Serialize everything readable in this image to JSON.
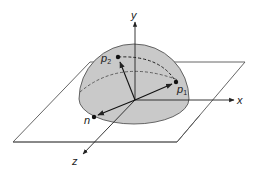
{
  "diagram": {
    "type": "hemisphere-on-plane",
    "axes": {
      "x_label": "x",
      "y_label": "y",
      "z_label": "z"
    },
    "points": {
      "p2": {
        "label": "p",
        "sub": "2"
      },
      "p1": {
        "label": "p",
        "sub": "1"
      },
      "n": {
        "label": "n"
      }
    },
    "colors": {
      "hemisphere_fill": "#c9c9c9",
      "stroke": "#333333",
      "plane_stroke": "#444444",
      "background": "#ffffff"
    }
  }
}
